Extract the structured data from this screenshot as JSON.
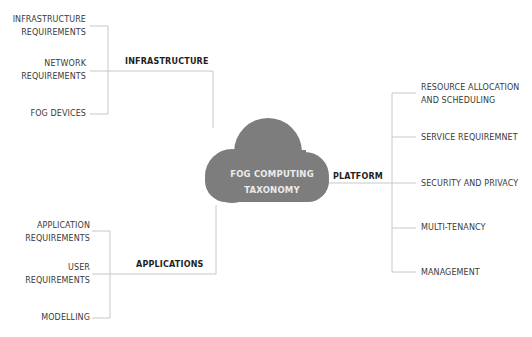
{
  "diagram": {
    "center": {
      "line1": "FOG COMPUTING",
      "line2": "TAXONOMY"
    },
    "colors": {
      "cloud": "#7d7d7d",
      "line": "#c8c8c8",
      "text": "#3a3a3a",
      "category_text": "#1e1e1e"
    },
    "categories": {
      "infrastructure": {
        "label": "INFRASTRUCTURE",
        "items": [
          {
            "line1": "INFRASTRUCTURE",
            "line2": "REQUIREMENTS"
          },
          {
            "line1": "NETWORK",
            "line2": "REQUIREMENTS"
          },
          {
            "line1": "FOG DEVICES"
          }
        ]
      },
      "applications": {
        "label": "APPLICATIONS",
        "items": [
          {
            "line1": "APPLICATION",
            "line2": "REQUIREMENTS"
          },
          {
            "line1": "USER",
            "line2": "REQUIREMENTS"
          },
          {
            "line1": "MODELLING"
          }
        ]
      },
      "platform": {
        "label": "PLATFORM",
        "items": [
          {
            "line1": "RESOURCE ALLOCATION",
            "line2": "AND SCHEDULING"
          },
          {
            "line1": "SERVICE REQUIREMNET"
          },
          {
            "line1": "SECURITY AND PRIVACY"
          },
          {
            "line1": "MULTI-TENANCY"
          },
          {
            "line1": "MANAGEMENT"
          }
        ]
      }
    }
  }
}
